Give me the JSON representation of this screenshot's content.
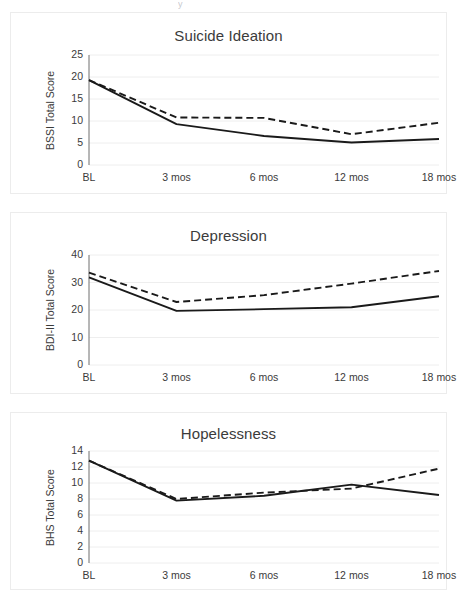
{
  "page": {
    "background": "#ffffff",
    "top_artifact_text": "y"
  },
  "style": {
    "axis_color": "#6e6e6e",
    "grid_color": "#eeeeee",
    "panel_border": "#ececec",
    "series_solid_color": "#1a1a1a",
    "series_dashed_color": "#1a1a1a",
    "text_color": "#3b3b3b"
  },
  "chart_data": [
    {
      "id": "suicide-ideation",
      "type": "line",
      "title": "Suicide Ideation",
      "xlabel": "",
      "ylabel": "BSSI Total Score",
      "categories": [
        "BL",
        "3 mos",
        "6 mos",
        "12 mos",
        "18 mos"
      ],
      "yticks": [
        0,
        5,
        10,
        15,
        20,
        25
      ],
      "ylim": [
        0,
        25
      ],
      "grid": true,
      "legend": "none",
      "series": [
        {
          "name": "solid",
          "style": "solid",
          "values": [
            19.3,
            9.3,
            6.6,
            5.1,
            5.9
          ]
        },
        {
          "name": "dashed",
          "style": "dashed",
          "values": [
            19.3,
            10.8,
            10.7,
            7.0,
            9.6
          ]
        }
      ]
    },
    {
      "id": "depression",
      "type": "line",
      "title": "Depression",
      "xlabel": "",
      "ylabel": "BDI-II Total Score",
      "categories": [
        "BL",
        "3 mos",
        "6 mos",
        "12 mos",
        "18 mos"
      ],
      "yticks": [
        0,
        10,
        20,
        30,
        40
      ],
      "ylim": [
        0,
        40
      ],
      "grid": true,
      "legend": "none",
      "series": [
        {
          "name": "solid",
          "style": "solid",
          "values": [
            31.9,
            19.7,
            20.3,
            21.0,
            25.0
          ]
        },
        {
          "name": "dashed",
          "style": "dashed",
          "values": [
            33.6,
            22.9,
            25.4,
            29.6,
            34.2
          ]
        }
      ]
    },
    {
      "id": "hopelessness",
      "type": "line",
      "title": "Hopelessness",
      "xlabel": "",
      "ylabel": "BHS Total Score",
      "categories": [
        "BL",
        "3 mos",
        "6 mos",
        "12 mos",
        "18 mos"
      ],
      "yticks": [
        0,
        2,
        4,
        6,
        8,
        10,
        12,
        14
      ],
      "ylim": [
        0,
        14
      ],
      "grid": true,
      "legend": "none",
      "series": [
        {
          "name": "solid",
          "style": "solid",
          "values": [
            12.8,
            7.8,
            8.4,
            9.8,
            8.5
          ]
        },
        {
          "name": "dashed",
          "style": "dashed",
          "values": [
            12.8,
            8.0,
            8.8,
            9.3,
            11.8
          ]
        }
      ]
    }
  ]
}
